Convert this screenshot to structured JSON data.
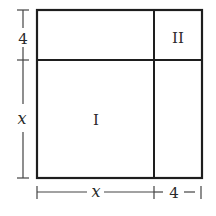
{
  "diagram": {
    "regions": [
      {
        "id": "I",
        "label": "I"
      },
      {
        "id": "II",
        "label": "II"
      }
    ],
    "dimensions": {
      "left_top": "4",
      "left_bottom": "x",
      "bottom_left": "x",
      "bottom_right": "4"
    },
    "colors": {
      "stroke": "#1e1e1e",
      "background": "#ffffff"
    }
  }
}
